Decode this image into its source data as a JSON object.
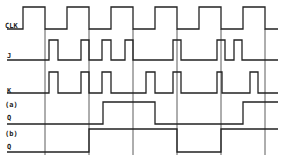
{
  "diagram": {
    "type": "timing-diagram",
    "signals": [
      {
        "id": "clk",
        "label": "CLK",
        "label_pos": [
          5,
          28
        ],
        "high_y": 7,
        "low_y": 29,
        "start_x": 7,
        "end_x": 278,
        "initial": 0,
        "edges": [
          23,
          45,
          67,
          89,
          111,
          133,
          155,
          177,
          199,
          221,
          243,
          265
        ]
      },
      {
        "id": "j",
        "label": "J",
        "label_pos": [
          7,
          58
        ],
        "high_y": 40,
        "low_y": 60,
        "start_x": 7,
        "end_x": 278,
        "initial": 0,
        "edges": [
          49,
          58,
          81,
          89,
          102,
          111,
          125,
          133,
          173,
          181,
          217,
          225,
          234,
          242
        ]
      },
      {
        "id": "k",
        "label": "K",
        "label_pos": [
          7,
          93
        ],
        "high_y": 72,
        "low_y": 93,
        "start_x": 7,
        "end_x": 278,
        "initial": 0,
        "edges": [
          49,
          58,
          81,
          89,
          102,
          111,
          146,
          155,
          173,
          181,
          217,
          222,
          250,
          258
        ]
      },
      {
        "id": "q_a",
        "label": "Q",
        "prefix": "(a)",
        "prefix_pos": [
          5,
          107
        ],
        "label_pos": [
          7,
          120
        ],
        "high_y": 102,
        "low_y": 124,
        "start_x": 7,
        "end_x": 278,
        "initial": 0,
        "edges": [
          103,
          155,
          243
        ]
      },
      {
        "id": "q_b",
        "label": "Q",
        "prefix": "(b)",
        "prefix_pos": [
          5,
          136
        ],
        "label_pos": [
          7,
          149
        ],
        "high_y": 129,
        "low_y": 152,
        "start_x": 7,
        "end_x": 278,
        "initial": 0,
        "edges": [
          89,
          177,
          221
        ]
      }
    ],
    "grid_lines": {
      "x": [
        45,
        89,
        133,
        177,
        221,
        265
      ],
      "y_top": 29,
      "y_bottom": 155
    },
    "colors": {
      "line": "#222222",
      "background": "#ffffff"
    }
  }
}
